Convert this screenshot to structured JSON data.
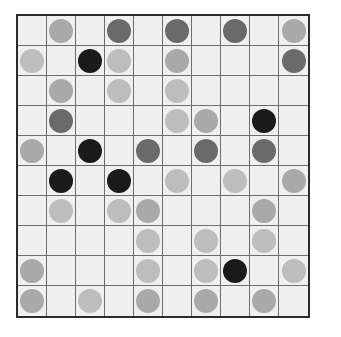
{
  "board": {
    "rows": 10,
    "cols": 10,
    "colors": {
      "black": "#1a1a1a",
      "dark": "#6a6a6a",
      "light": "#a9a9a9",
      "lighter": "#bdbdbd",
      "background": "#f0f0f0",
      "grid": "#6e6e6e"
    },
    "cells": [
      [
        "",
        "light",
        "",
        "dark",
        "",
        "dark",
        "",
        "dark",
        "",
        "light"
      ],
      [
        "lighter",
        "",
        "black",
        "lighter",
        "",
        "light",
        "",
        "",
        "",
        "dark"
      ],
      [
        "",
        "light",
        "",
        "lighter",
        "",
        "lighter",
        "",
        "",
        "",
        ""
      ],
      [
        "",
        "dark",
        "",
        "",
        "",
        "lighter",
        "light",
        "",
        "black",
        ""
      ],
      [
        "light",
        "",
        "black",
        "",
        "dark",
        "",
        "dark",
        "",
        "dark",
        ""
      ],
      [
        "",
        "black",
        "",
        "black",
        "",
        "lighter",
        "",
        "lighter",
        "",
        "light"
      ],
      [
        "",
        "lighter",
        "",
        "lighter",
        "light",
        "",
        "",
        "",
        "light",
        ""
      ],
      [
        "",
        "",
        "",
        "",
        "lighter",
        "",
        "lighter",
        "",
        "lighter",
        ""
      ],
      [
        "light",
        "",
        "",
        "",
        "lighter",
        "",
        "lighter",
        "black",
        "",
        "lighter"
      ],
      [
        "light",
        "",
        "lighter",
        "",
        "light",
        "",
        "light",
        "",
        "light",
        ""
      ]
    ]
  }
}
